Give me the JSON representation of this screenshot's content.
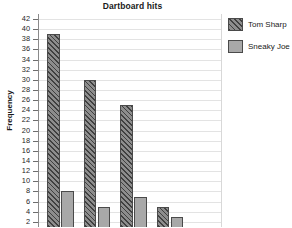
{
  "chart_data": {
    "type": "bar",
    "title": "Dartboard hits",
    "xlabel": "",
    "ylabel": "Frequency",
    "ylim": [
      0,
      43
    ],
    "ytick_step": 2,
    "yticks": [
      2,
      4,
      6,
      8,
      10,
      12,
      14,
      16,
      18,
      20,
      22,
      24,
      26,
      28,
      30,
      32,
      34,
      36,
      38,
      40,
      42
    ],
    "ytick_labels": [
      "2",
      "4",
      "6",
      "8",
      "10",
      "12",
      "14",
      "16",
      "18",
      "20",
      "22",
      "24",
      "26",
      "28",
      "30",
      "32",
      "34",
      "36",
      "38",
      "40",
      "42"
    ],
    "categories": [
      "",
      "",
      "",
      ""
    ],
    "grid": "horizontal",
    "legend_position": "right",
    "series": [
      {
        "name": "Tom Sharp",
        "fill": "diagonal-hatch",
        "color": "#8d8d8d",
        "values": [
          39,
          30,
          25,
          5
        ]
      },
      {
        "name": "Sneaky Joe",
        "fill": "solid",
        "color": "#a8a8a8",
        "values": [
          8,
          5,
          7,
          3
        ]
      }
    ],
    "note": "x-axis category labels are cropped out of the bottom of the screenshot"
  },
  "legend": {
    "items": [
      {
        "label": "Tom Sharp"
      },
      {
        "label": "Sneaky Joe"
      }
    ]
  },
  "colors": {
    "gridline": "#e3e3e3",
    "axis": "#8a8a8a",
    "bar_outline": "#4a4a4a",
    "text": "#1a1a1a"
  }
}
